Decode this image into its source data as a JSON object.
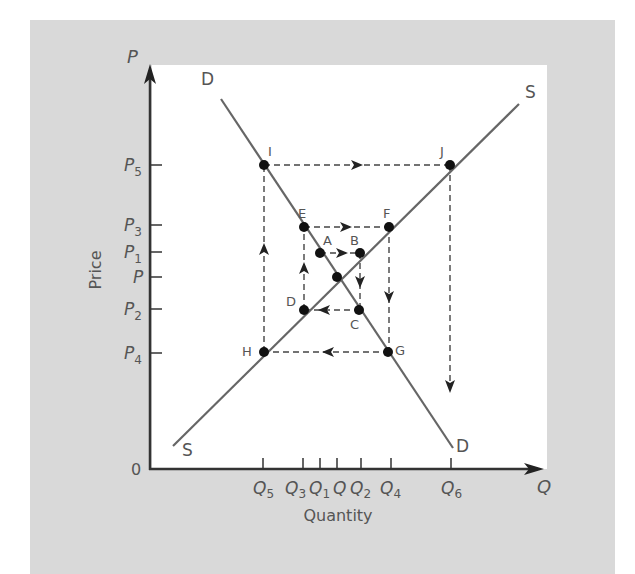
{
  "colors": {
    "background_panel": "#d9d9d9",
    "plot_area": "#ffffff",
    "curve": "#666666",
    "axis": "#333333",
    "dashed": "#444444",
    "point": "#111111",
    "text": "#555555"
  },
  "axes": {
    "y_axis_symbol": "P",
    "x_axis_symbol": "Q",
    "y_label": "Price",
    "x_label": "Quantity",
    "origin_label": "0",
    "y_ticks": [
      {
        "base": "P",
        "sub": "5"
      },
      {
        "base": "P",
        "sub": "3"
      },
      {
        "base": "P",
        "sub": "1"
      },
      {
        "base": "P",
        "sub": ""
      },
      {
        "base": "P",
        "sub": "2"
      },
      {
        "base": "P",
        "sub": "4"
      }
    ],
    "x_ticks": [
      {
        "base": "Q",
        "sub": "5"
      },
      {
        "base": "Q",
        "sub": "3"
      },
      {
        "base": "Q",
        "sub": "1"
      },
      {
        "base": "Q",
        "sub": ""
      },
      {
        "base": "Q",
        "sub": "2"
      },
      {
        "base": "Q",
        "sub": "4"
      },
      {
        "base": "Q",
        "sub": "6"
      }
    ]
  },
  "curves": {
    "demand_label_top": "D",
    "demand_label_bottom": "D",
    "supply_label_top": "S",
    "supply_label_bottom": "S"
  },
  "points": {
    "A": "A",
    "B": "B",
    "C": "C",
    "D": "D",
    "E": "E",
    "F": "F",
    "G": "G",
    "H": "H",
    "I": "I",
    "J": "J"
  }
}
